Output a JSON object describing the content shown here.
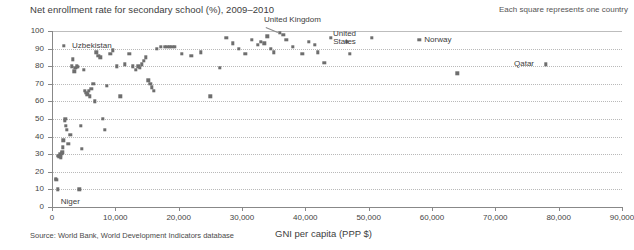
{
  "chart_data": {
    "type": "scatter",
    "title": "Net enrollment rate for secondary school (%), 2009–2010",
    "note": "Each square represents one country",
    "source": "Source: World Bank, World Development Indicators database",
    "xlabel": "GNI per capita (PPP $)",
    "ylabel": "",
    "xlim": [
      0,
      90000
    ],
    "ylim": [
      0,
      100
    ],
    "xticks": [
      0,
      10000,
      20000,
      30000,
      40000,
      50000,
      60000,
      70000,
      80000,
      90000
    ],
    "xticklabels": [
      "0",
      "10,000",
      "20,000",
      "30,000",
      "40,000",
      "50,000",
      "60,000",
      "70,000",
      "80,000",
      "90,000"
    ],
    "yticks": [
      0,
      10,
      20,
      30,
      40,
      50,
      60,
      70,
      80,
      90,
      100
    ],
    "yticklabels": [
      "0",
      "10",
      "20",
      "30",
      "40",
      "50",
      "60",
      "70",
      "80",
      "90",
      "100"
    ],
    "grid": true,
    "marker": "square",
    "marker_color": "#6e6e6e",
    "points": [
      [
        600,
        16
      ],
      [
        700,
        15.5
      ],
      [
        900,
        10
      ],
      [
        1000,
        29
      ],
      [
        1100,
        28.5
      ],
      [
        1200,
        30
      ],
      [
        1300,
        29
      ],
      [
        1400,
        28
      ],
      [
        1500,
        30.5
      ],
      [
        1600,
        31
      ],
      [
        1700,
        34
      ],
      [
        1800,
        38
      ],
      [
        1900,
        91.5
      ],
      [
        2000,
        49
      ],
      [
        2100,
        50
      ],
      [
        2200,
        46
      ],
      [
        2300,
        44
      ],
      [
        2600,
        36
      ],
      [
        2900,
        41
      ],
      [
        3100,
        80
      ],
      [
        3300,
        84
      ],
      [
        3500,
        77
      ],
      [
        3700,
        79
      ],
      [
        3900,
        80
      ],
      [
        4100,
        79.5
      ],
      [
        4300,
        10
      ],
      [
        4500,
        46
      ],
      [
        4700,
        33
      ],
      [
        5000,
        78
      ],
      [
        5200,
        66
      ],
      [
        5400,
        65
      ],
      [
        5600,
        64
      ],
      [
        5800,
        66
      ],
      [
        6000,
        63
      ],
      [
        6200,
        67
      ],
      [
        6500,
        70
      ],
      [
        6800,
        60
      ],
      [
        7000,
        88
      ],
      [
        7300,
        86
      ],
      [
        7600,
        85
      ],
      [
        8000,
        50
      ],
      [
        8300,
        44
      ],
      [
        8700,
        69
      ],
      [
        9200,
        87
      ],
      [
        9600,
        89
      ],
      [
        10200,
        80
      ],
      [
        10800,
        63
      ],
      [
        11500,
        81
      ],
      [
        12200,
        87
      ],
      [
        12800,
        80
      ],
      [
        13200,
        78
      ],
      [
        13600,
        80
      ],
      [
        13900,
        79
      ],
      [
        14200,
        81
      ],
      [
        14500,
        83
      ],
      [
        14800,
        85
      ],
      [
        15200,
        72
      ],
      [
        15500,
        70
      ],
      [
        15800,
        68
      ],
      [
        16100,
        66
      ],
      [
        16500,
        90
      ],
      [
        17200,
        91
      ],
      [
        17800,
        91
      ],
      [
        18200,
        91
      ],
      [
        18600,
        91
      ],
      [
        19000,
        91
      ],
      [
        19400,
        91
      ],
      [
        20500,
        87
      ],
      [
        22000,
        86
      ],
      [
        23500,
        88
      ],
      [
        25000,
        63
      ],
      [
        26500,
        79
      ],
      [
        27500,
        96
      ],
      [
        28500,
        93
      ],
      [
        29500,
        90
      ],
      [
        30500,
        87
      ],
      [
        31500,
        95
      ],
      [
        32500,
        92
      ],
      [
        33000,
        94
      ],
      [
        33500,
        93
      ],
      [
        34000,
        97
      ],
      [
        34500,
        90
      ],
      [
        35000,
        88
      ],
      [
        36000,
        99
      ],
      [
        36500,
        98
      ],
      [
        37000,
        95
      ],
      [
        38000,
        91
      ],
      [
        39500,
        87
      ],
      [
        40500,
        94
      ],
      [
        41500,
        92
      ],
      [
        42000,
        88
      ],
      [
        43000,
        82
      ],
      [
        44000,
        96
      ],
      [
        46500,
        94
      ],
      [
        47000,
        87
      ],
      [
        50500,
        96
      ],
      [
        58000,
        95
      ],
      [
        64000,
        76
      ],
      [
        78000,
        81
      ]
    ],
    "annotations": [
      {
        "label": "Uzbekistan",
        "x": 1900,
        "y": 91.5,
        "dx": 8,
        "dy": -4,
        "align": "left",
        "leader": false
      },
      {
        "label": "Niger",
        "x": 900,
        "y": 10,
        "dx": 3,
        "dy": 9,
        "align": "left",
        "leader": false
      },
      {
        "label": "United Kingdom",
        "x": 36000,
        "y": 99,
        "dx": -16,
        "dy": -17,
        "align": "left",
        "leader": true
      },
      {
        "label": "United\nStates",
        "x": 46500,
        "y": 94,
        "dx": -2,
        "dy": -12,
        "align": "center",
        "leader": false
      },
      {
        "label": "Norway",
        "x": 58000,
        "y": 95,
        "dx": 5,
        "dy": -4,
        "align": "left",
        "leader": false
      },
      {
        "label": "Qatar",
        "x": 78000,
        "y": 81,
        "dx": -32,
        "dy": -4,
        "align": "left",
        "leader": false
      }
    ]
  }
}
